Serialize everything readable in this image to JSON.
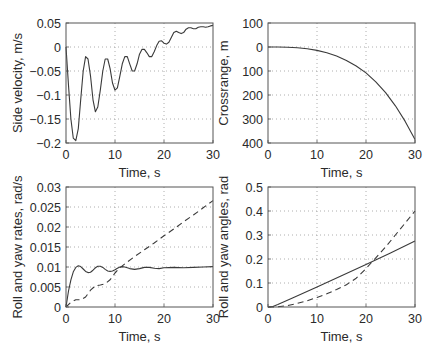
{
  "chart_data": [
    {
      "type": "line",
      "title": "",
      "xlabel": "Time, s",
      "ylabel": "Side velocity, m/s",
      "xlim": [
        0,
        30
      ],
      "ylim": [
        -0.2,
        0.05
      ],
      "xticks": [
        0,
        10,
        20,
        30
      ],
      "yticks": [
        0.05,
        0,
        -0.05,
        -0.1,
        -0.15,
        -0.2
      ],
      "ytick_labels": [
        "0.05",
        "0",
        "-0.05",
        "-0.1",
        "-0.15",
        "-0.2"
      ],
      "y_inverted": false,
      "grid": true,
      "series": [
        {
          "name": "side velocity",
          "style": "solid",
          "x": [
            0,
            0.5,
            1,
            1.5,
            2,
            2.5,
            3,
            3.5,
            4,
            4.5,
            5,
            5.5,
            6,
            6.5,
            7,
            7.5,
            8,
            8.5,
            9,
            9.5,
            10,
            10.5,
            11,
            11.5,
            12,
            12.5,
            13,
            13.5,
            14,
            14.5,
            15,
            15.5,
            16,
            16.5,
            17,
            17.5,
            18,
            18.5,
            19,
            19.5,
            20,
            20.5,
            21,
            21.5,
            22,
            22.5,
            23,
            23.5,
            24,
            24.5,
            25,
            25.5,
            26,
            26.5,
            27,
            27.5,
            28,
            28.5,
            29,
            29.5,
            30
          ],
          "y": [
            0,
            -0.08,
            -0.15,
            -0.19,
            -0.195,
            -0.17,
            -0.11,
            -0.05,
            -0.02,
            -0.025,
            -0.06,
            -0.11,
            -0.135,
            -0.125,
            -0.09,
            -0.05,
            -0.025,
            -0.025,
            -0.045,
            -0.075,
            -0.09,
            -0.085,
            -0.06,
            -0.035,
            -0.02,
            -0.02,
            -0.035,
            -0.05,
            -0.05,
            -0.035,
            -0.015,
            -0.005,
            -0.005,
            -0.012,
            -0.02,
            -0.02,
            -0.01,
            0.003,
            0.012,
            0.013,
            0.008,
            0.006,
            0.01,
            0.02,
            0.03,
            0.033,
            0.03,
            0.028,
            0.03,
            0.037,
            0.04,
            0.04,
            0.038,
            0.038,
            0.041,
            0.042,
            0.042,
            0.041,
            0.042,
            0.044,
            0.045
          ]
        }
      ]
    },
    {
      "type": "line",
      "title": "",
      "xlabel": "Time, s",
      "ylabel": "Crossrange, m",
      "xlim": [
        0,
        30
      ],
      "ylim": [
        -400,
        100
      ],
      "xticks": [
        0,
        10,
        20,
        30
      ],
      "yticks": [
        100,
        0,
        -100,
        -200,
        -300,
        -400
      ],
      "ytick_labels": [
        "100",
        "0",
        "100",
        "200",
        "300",
        "400"
      ],
      "grid": true,
      "series": [
        {
          "name": "crossrange",
          "style": "solid",
          "x": [
            0,
            2,
            4,
            6,
            8,
            10,
            12,
            14,
            16,
            18,
            20,
            22,
            24,
            26,
            28,
            30
          ],
          "y": [
            0,
            -0.2,
            -1,
            -3,
            -7,
            -14,
            -24,
            -38,
            -56,
            -79,
            -108,
            -145,
            -190,
            -245,
            -310,
            -385
          ]
        }
      ]
    },
    {
      "type": "line",
      "title": "",
      "xlabel": "Time, s",
      "ylabel": "Roll and yaw rates, rad/s",
      "xlim": [
        0,
        30
      ],
      "ylim": [
        0,
        0.03
      ],
      "xticks": [
        0,
        10,
        20,
        30
      ],
      "yticks": [
        0.03,
        0.025,
        0.02,
        0.015,
        0.01,
        0.005,
        0
      ],
      "ytick_labels": [
        "0.03",
        "0.025",
        "0.02",
        "0.015",
        "0.01",
        "0.005",
        "0"
      ],
      "grid": true,
      "series": [
        {
          "name": "roll rate",
          "style": "solid",
          "x": [
            0,
            0.5,
            1,
            1.5,
            2,
            2.5,
            3,
            3.5,
            4,
            4.5,
            5,
            5.5,
            6,
            6.5,
            7,
            7.5,
            8,
            8.5,
            9,
            9.5,
            10,
            10.5,
            11,
            11.5,
            12,
            13,
            14,
            15,
            16,
            17,
            18,
            19,
            20,
            22,
            24,
            26,
            28,
            30
          ],
          "y": [
            0,
            0.004,
            0.0068,
            0.0088,
            0.0099,
            0.0103,
            0.0101,
            0.0095,
            0.0089,
            0.0086,
            0.0087,
            0.0092,
            0.0098,
            0.0102,
            0.0102,
            0.0099,
            0.0094,
            0.009,
            0.0089,
            0.009,
            0.0093,
            0.0097,
            0.01,
            0.0101,
            0.01,
            0.0096,
            0.0094,
            0.0096,
            0.0099,
            0.0099,
            0.0097,
            0.0096,
            0.0098,
            0.0099,
            0.0098,
            0.0099,
            0.01,
            0.0101
          ]
        },
        {
          "name": "yaw rate",
          "style": "dashed",
          "x": [
            0,
            1,
            2,
            3,
            4,
            5,
            6,
            7,
            8,
            9,
            10,
            11,
            12,
            14,
            16,
            18,
            20,
            22,
            24,
            26,
            28,
            30
          ],
          "y": [
            0,
            0.0012,
            0.0018,
            0.0018,
            0.0025,
            0.0042,
            0.0053,
            0.0055,
            0.0058,
            0.0068,
            0.0085,
            0.0098,
            0.0108,
            0.0126,
            0.0143,
            0.016,
            0.0178,
            0.0195,
            0.0213,
            0.023,
            0.0248,
            0.0266
          ]
        }
      ]
    },
    {
      "type": "line",
      "title": "",
      "xlabel": "Time, s",
      "ylabel": "Roll and yaw angles, rad",
      "xlim": [
        0,
        30
      ],
      "ylim": [
        0,
        0.5
      ],
      "xticks": [
        0,
        10,
        20,
        30
      ],
      "yticks": [
        0.5,
        0.4,
        0.3,
        0.2,
        0.1,
        0
      ],
      "ytick_labels": [
        "0.5",
        "0.4",
        "0.3",
        "0.2",
        "0.1",
        "0"
      ],
      "grid": true,
      "series": [
        {
          "name": "roll angle",
          "style": "solid",
          "x": [
            0,
            1,
            2,
            5,
            10,
            15,
            20,
            25,
            30
          ],
          "y": [
            0,
            0.002,
            0.01,
            0.037,
            0.083,
            0.13,
            0.177,
            0.225,
            0.275
          ]
        },
        {
          "name": "yaw angle",
          "style": "dashed",
          "x": [
            0,
            2,
            4,
            6,
            8,
            10,
            12,
            14,
            16,
            18,
            20,
            22,
            24,
            26,
            28,
            30
          ],
          "y": [
            0,
            0.001,
            0.006,
            0.015,
            0.026,
            0.04,
            0.055,
            0.073,
            0.093,
            0.12,
            0.16,
            0.205,
            0.25,
            0.3,
            0.35,
            0.4
          ]
        }
      ]
    }
  ],
  "panels": [
    {
      "xlabel": "Time, s",
      "ylabel": "Side velocity, m/s"
    },
    {
      "xlabel": "Time, s",
      "ylabel": "Crossrange, m"
    },
    {
      "xlabel": "Time, s",
      "ylabel": "Roll and yaw rates, rad/s"
    },
    {
      "xlabel": "Time, s",
      "ylabel": "Roll and yaw angles, rad"
    }
  ],
  "colors": {
    "line": "#3a3a3a",
    "axis": "#555555",
    "grid": "#9a9a9a",
    "text": "#2a2a2a"
  }
}
